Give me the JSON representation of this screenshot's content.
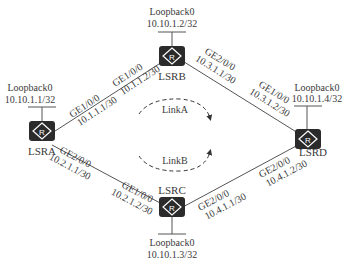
{
  "diagram": {
    "type": "network-topology",
    "routers": [
      {
        "id": "LSRA",
        "name": "LSRA",
        "icon": "router-icon",
        "loopback": {
          "label": "Loopback0",
          "ip": "10.10.1.1/32"
        }
      },
      {
        "id": "LSRB",
        "name": "LSRB",
        "icon": "router-icon",
        "loopback": {
          "label": "Loopback0",
          "ip": "10.10.1.2/32"
        }
      },
      {
        "id": "LSRC",
        "name": "LSRC",
        "icon": "router-icon",
        "loopback": {
          "label": "Loopback0",
          "ip": "10.10.1.3/32"
        }
      },
      {
        "id": "LSRD",
        "name": "LSRD",
        "icon": "router-icon",
        "loopback": {
          "label": "Loopback0",
          "ip": "10.10.1.4/32"
        }
      }
    ],
    "links": [
      {
        "from": "LSRA",
        "from_if": "GE1/0/0",
        "from_ip": "10.1.1.1/30",
        "to": "LSRB",
        "to_if": "GE1/0/0",
        "to_ip": "10.1.1.2/30"
      },
      {
        "from": "LSRB",
        "from_if": "GE2/0/0",
        "from_ip": "10.3.1.1/30",
        "to": "LSRD",
        "to_if": "GE1/0/0",
        "to_ip": "10.3.1.2/30"
      },
      {
        "from": "LSRA",
        "from_if": "GE2/0/0",
        "from_ip": "10.2.1.1/30",
        "to": "LSRC",
        "to_if": "GE1/0/0",
        "to_ip": "10.2.1.2/30"
      },
      {
        "from": "LSRC",
        "from_if": "GE2/0/0",
        "from_ip": "10.4.1.1/30",
        "to": "LSRD",
        "to_if": "GE2/0/0",
        "to_ip": "10.4.1.2/30"
      }
    ],
    "paths": [
      {
        "name": "LinkA",
        "via": "LSRB"
      },
      {
        "name": "LinkB",
        "via": "LSRC"
      }
    ],
    "colors": {
      "router_fill": "#2b2b2b",
      "line": "#555555",
      "text": "#3a3a3a"
    }
  }
}
